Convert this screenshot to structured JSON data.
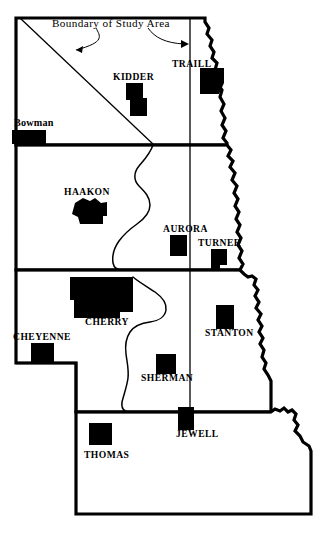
{
  "figure": {
    "type": "map",
    "region": "Great Plains states study area",
    "background_color": "#ffffff",
    "ink_color": "#000000",
    "width": 330,
    "height": 551
  },
  "annotations": {
    "caption": "Boundary of Study Area",
    "leader_count": 2
  },
  "states": [
    {
      "id": "north-dakota",
      "name": "North Dakota"
    },
    {
      "id": "south-dakota",
      "name": "South Dakota"
    },
    {
      "id": "nebraska",
      "name": "Nebraska"
    },
    {
      "id": "kansas",
      "name": "Kansas"
    }
  ],
  "counties": [
    {
      "id": "bowman",
      "label": "Bowman",
      "state": "North Dakota",
      "label_style": "mixed-case",
      "label_x": 14,
      "label_y": 126,
      "patch_x": 12,
      "patch_y": 130,
      "patch_w": 34,
      "patch_h": 14
    },
    {
      "id": "kidder",
      "label": "KIDDER",
      "state": "North Dakota",
      "label_style": "caps",
      "label_x": 113,
      "label_y": 80,
      "patch_x": 126,
      "patch_y": 83,
      "patch_w": 21,
      "patch_h": 33
    },
    {
      "id": "traill",
      "label": "TRAILL",
      "state": "North Dakota",
      "label_style": "caps",
      "label_x": 172,
      "label_y": 67,
      "patch_x": 200,
      "patch_y": 68,
      "patch_w": 24,
      "patch_h": 26
    },
    {
      "id": "haakon",
      "label": "HAAKON",
      "state": "South Dakota",
      "label_style": "caps",
      "label_x": 64,
      "label_y": 195,
      "patch_x": 72,
      "patch_y": 198,
      "patch_w": 35,
      "patch_h": 26
    },
    {
      "id": "aurora",
      "label": "AURORA",
      "state": "South Dakota",
      "label_style": "caps",
      "label_x": 163,
      "label_y": 232,
      "patch_x": 170,
      "patch_y": 235,
      "patch_w": 17,
      "patch_h": 21
    },
    {
      "id": "turner",
      "label": "TURNER",
      "state": "South Dakota",
      "label_style": "caps",
      "label_x": 198,
      "label_y": 246,
      "patch_x": 211,
      "patch_y": 249,
      "patch_w": 16,
      "patch_h": 21
    },
    {
      "id": "cherry",
      "label": "CHERRY",
      "state": "Nebraska",
      "label_style": "caps",
      "label_x": 85,
      "label_y": 325,
      "patch_x": 70,
      "patch_y": 277,
      "patch_w": 63,
      "patch_h": 41
    },
    {
      "id": "cheyenne",
      "label": "CHEYENNE",
      "state": "Nebraska",
      "label_style": "caps",
      "label_x": 13,
      "label_y": 340,
      "patch_x": 31,
      "patch_y": 343,
      "patch_w": 23,
      "patch_h": 20
    },
    {
      "id": "stanton",
      "label": "STANTON",
      "state": "Nebraska",
      "label_style": "caps",
      "label_x": 205,
      "label_y": 336,
      "patch_x": 216,
      "patch_y": 305,
      "patch_w": 18,
      "patch_h": 24
    },
    {
      "id": "sherman",
      "label": "SHERMAN",
      "state": "Nebraska",
      "label_style": "caps",
      "label_x": 141,
      "label_y": 381,
      "patch_x": 156,
      "patch_y": 354,
      "patch_w": 20,
      "patch_h": 20
    },
    {
      "id": "jewell",
      "label": "JEWELL",
      "state": "Kansas",
      "label_style": "caps",
      "label_x": 176,
      "label_y": 437,
      "patch_x": 178,
      "patch_y": 407,
      "patch_w": 16,
      "patch_h": 23
    },
    {
      "id": "thomas",
      "label": "THOMAS",
      "state": "Kansas",
      "label_style": "caps",
      "label_x": 84,
      "label_y": 458,
      "patch_x": 89,
      "patch_y": 423,
      "patch_w": 23,
      "patch_h": 22
    }
  ]
}
